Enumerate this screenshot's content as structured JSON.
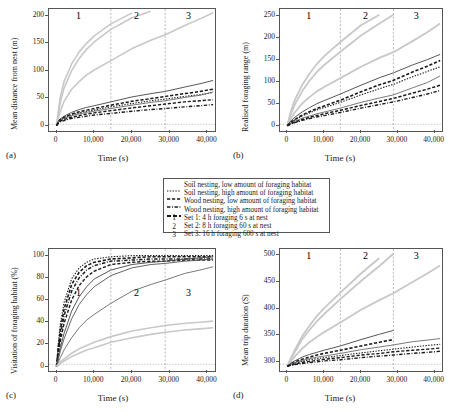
{
  "figure": {
    "xlabel": "Time (s)",
    "xticks": [
      "0",
      "10,000",
      "20,000",
      "30,000",
      "40,000"
    ],
    "xtick_values": [
      0,
      10000,
      20000,
      30000,
      40000
    ],
    "xlim": [
      -2000,
      42000
    ],
    "set_markers": [
      "1",
      "2",
      "3"
    ],
    "set_divider_x": [
      14400,
      28800
    ],
    "panel_tags": {
      "a": "(a)",
      "b": "(b)",
      "c": "(c)",
      "d": "(d)"
    }
  },
  "legend": {
    "series": [
      {
        "label": "Soil nesting, low amount of foraging habitat",
        "style": "fine-dotted",
        "color": "#1a1a1a"
      },
      {
        "label": "Soil nesting, high amount of foraging habitat",
        "style": "dashed",
        "color": "#1a1a1a"
      },
      {
        "label": "Wood nesting, low amount of foraging habitat",
        "style": "dash-dot",
        "color": "#1a1a1a"
      },
      {
        "label": "Wood nesting, high amount of foraging habitat",
        "style": "thick-dashed",
        "color": "#1a1a1a"
      }
    ],
    "sets": [
      {
        "key": "1",
        "label": "Set 1: 4 h foraging 6 s at nest"
      },
      {
        "key": "2",
        "label": "Set 2: 8 h foraging 60 s at nest"
      },
      {
        "key": "3",
        "label": "Set 3: 16 h foraging 600 s at nest"
      }
    ]
  },
  "chart_data": [
    {
      "panel": "a",
      "type": "line",
      "title": "",
      "xlabel": "Time (s)",
      "ylabel": "Mean distance from nest (m)",
      "xlim": [
        -2000,
        42000
      ],
      "ylim": [
        -10,
        212
      ],
      "yticks": [
        "0",
        "50",
        "100",
        "150",
        "200"
      ],
      "ytick_values": [
        0,
        50,
        100,
        150,
        200
      ],
      "grid": false,
      "legend_position": "external",
      "x": [
        0,
        500,
        1000,
        2000,
        4000,
        6000,
        8000,
        10000,
        14400,
        20000,
        25000,
        28800,
        34000,
        38000,
        41500
      ],
      "series": [
        {
          "name": "grey-steep-1",
          "color": "#c8c8c8",
          "width": 1.6,
          "style": "solid",
          "values": [
            0,
            28,
            52,
            80,
            112,
            134,
            150,
            163,
            185,
            205,
            null,
            null,
            null,
            null,
            null
          ]
        },
        {
          "name": "grey-steep-2",
          "color": "#c8c8c8",
          "width": 1.6,
          "style": "solid",
          "values": [
            0,
            22,
            42,
            68,
            100,
            122,
            139,
            152,
            175,
            196,
            208,
            null,
            null,
            null,
            null
          ]
        },
        {
          "name": "grey-mid",
          "color": "#c8c8c8",
          "width": 1.6,
          "style": "solid",
          "values": [
            0,
            14,
            26,
            44,
            66,
            80,
            92,
            101,
            118,
            140,
            155,
            165,
            182,
            194,
            205
          ]
        },
        {
          "name": "black-solid-high",
          "color": "#444444",
          "width": 0.9,
          "style": "solid",
          "values": [
            0,
            8,
            12,
            17,
            24,
            29,
            33,
            36,
            43,
            52,
            58,
            62,
            70,
            76,
            82
          ]
        },
        {
          "name": "black-dash-thick",
          "color": "#1a1a1a",
          "width": 1.5,
          "style": "dashed",
          "values": [
            0,
            7,
            11,
            15,
            21,
            25,
            28,
            31,
            37,
            44,
            49,
            53,
            58,
            62,
            66
          ]
        },
        {
          "name": "black-dot-fine",
          "color": "#1a1a1a",
          "width": 1.1,
          "style": "fine-dotted",
          "values": [
            0,
            6,
            10,
            14,
            19,
            23,
            26,
            28,
            34,
            40,
            45,
            48,
            53,
            56,
            60
          ]
        },
        {
          "name": "black-solid-low",
          "color": "#6a6a6a",
          "width": 0.9,
          "style": "solid",
          "values": [
            0,
            6,
            9,
            13,
            18,
            21,
            24,
            26,
            31,
            37,
            42,
            45,
            51,
            55,
            61
          ]
        },
        {
          "name": "black-dash-mid",
          "color": "#1a1a1a",
          "width": 1.4,
          "style": "dashed",
          "values": [
            0,
            5,
            8,
            11,
            15,
            18,
            21,
            23,
            27,
            32,
            36,
            39,
            43,
            45,
            47
          ]
        },
        {
          "name": "black-dashdot-low",
          "color": "#1a1a1a",
          "width": 1.4,
          "style": "dash-dot",
          "values": [
            0,
            4,
            7,
            9,
            13,
            15,
            17,
            19,
            22,
            26,
            29,
            31,
            34,
            36,
            38
          ]
        }
      ]
    },
    {
      "panel": "b",
      "type": "line",
      "title": "",
      "xlabel": "Time (s)",
      "ylabel": "Realised foraging range (m)",
      "xlim": [
        -2000,
        42000
      ],
      "ylim": [
        -12,
        265
      ],
      "yticks": [
        "0",
        "50",
        "100",
        "150",
        "200",
        "250"
      ],
      "ytick_values": [
        0,
        50,
        100,
        150,
        200,
        250
      ],
      "grid": false,
      "legend_position": "external",
      "x": [
        0,
        500,
        1000,
        2000,
        4000,
        6000,
        8000,
        10000,
        14400,
        20000,
        25000,
        28800,
        34000,
        38000,
        41500
      ],
      "series": [
        {
          "name": "grey-steep-1",
          "color": "#c8c8c8",
          "width": 1.8,
          "style": "solid",
          "values": [
            0,
            18,
            34,
            58,
            92,
            118,
            140,
            158,
            190,
            228,
            252,
            null,
            null,
            null,
            null
          ]
        },
        {
          "name": "grey-steep-2",
          "color": "#c8c8c8",
          "width": 1.8,
          "style": "solid",
          "values": [
            0,
            14,
            27,
            48,
            78,
            102,
            122,
            138,
            168,
            205,
            232,
            252,
            null,
            null,
            null
          ]
        },
        {
          "name": "grey-mid",
          "color": "#c8c8c8",
          "width": 1.8,
          "style": "solid",
          "values": [
            0,
            9,
            17,
            30,
            50,
            65,
            78,
            88,
            108,
            134,
            154,
            167,
            192,
            212,
            232
          ]
        },
        {
          "name": "black-solid-high",
          "color": "#444444",
          "width": 0.9,
          "style": "solid",
          "values": [
            0,
            6,
            11,
            19,
            31,
            41,
            50,
            57,
            72,
            92,
            109,
            120,
            138,
            150,
            162
          ]
        },
        {
          "name": "black-dash-thick",
          "color": "#1a1a1a",
          "width": 1.6,
          "style": "dashed",
          "values": [
            0,
            4,
            8,
            14,
            24,
            32,
            39,
            45,
            58,
            77,
            93,
            103,
            122,
            135,
            148
          ]
        },
        {
          "name": "black-dot-fine",
          "color": "#1a1a1a",
          "width": 1.1,
          "style": "fine-dotted",
          "values": [
            0,
            4,
            7,
            13,
            22,
            29,
            36,
            41,
            53,
            70,
            84,
            94,
            111,
            123,
            134
          ]
        },
        {
          "name": "black-solid-low",
          "color": "#6a6a6a",
          "width": 0.9,
          "style": "solid",
          "values": [
            0,
            3,
            6,
            10,
            17,
            22,
            27,
            31,
            40,
            53,
            63,
            70,
            86,
            98,
            113
          ]
        },
        {
          "name": "black-dash-mid",
          "color": "#1a1a1a",
          "width": 1.5,
          "style": "dashed",
          "values": [
            0,
            2,
            5,
            8,
            14,
            19,
            23,
            27,
            35,
            46,
            55,
            62,
            74,
            83,
            92
          ]
        },
        {
          "name": "black-dashdot-low",
          "color": "#1a1a1a",
          "width": 1.4,
          "style": "dash-dot",
          "values": [
            0,
            2,
            4,
            7,
            12,
            16,
            20,
            23,
            30,
            40,
            48,
            54,
            64,
            72,
            80
          ]
        }
      ]
    },
    {
      "panel": "c",
      "type": "line",
      "title": "",
      "xlabel": "Time (s)",
      "ylabel": "Visitation of foraging habitat (%)",
      "xlim": [
        -2000,
        42000
      ],
      "ylim": [
        -4,
        106
      ],
      "yticks": [
        "0",
        "20",
        "40",
        "60",
        "80",
        "100"
      ],
      "ytick_values": [
        0,
        20,
        40,
        60,
        80,
        100
      ],
      "grid": false,
      "legend_position": "external",
      "x": [
        0,
        500,
        1000,
        2000,
        4000,
        6000,
        8000,
        10000,
        14400,
        20000,
        25000,
        28800,
        34000,
        38000,
        41500
      ],
      "series": [
        {
          "name": "black-dot-fastest",
          "color": "#1a1a1a",
          "width": 1.1,
          "style": "fine-dotted",
          "values": [
            0,
            22,
            38,
            58,
            79,
            89,
            94,
            97,
            99,
            100,
            100,
            100,
            100,
            100,
            100
          ]
        },
        {
          "name": "black-dash-fast",
          "color": "#1a1a1a",
          "width": 1.6,
          "style": "dashed",
          "values": [
            0,
            18,
            33,
            52,
            74,
            85,
            91,
            94,
            97,
            98,
            99,
            99,
            99,
            99,
            99
          ]
        },
        {
          "name": "black-dashdot-fast",
          "color": "#1a1a1a",
          "width": 1.5,
          "style": "dash-dot",
          "values": [
            0,
            15,
            28,
            46,
            68,
            80,
            87,
            91,
            95,
            96,
            97,
            97,
            97,
            97,
            97
          ]
        },
        {
          "name": "black-dash-mid",
          "color": "#1a1a1a",
          "width": 1.4,
          "style": "dashed",
          "values": [
            0,
            12,
            23,
            39,
            60,
            73,
            81,
            86,
            92,
            94,
            95,
            95,
            96,
            96,
            96
          ]
        },
        {
          "name": "black-solid-high",
          "color": "#444444",
          "width": 0.9,
          "style": "solid",
          "values": [
            0,
            9,
            17,
            30,
            50,
            63,
            72,
            79,
            87,
            92,
            94,
            95,
            97,
            98,
            99
          ]
        },
        {
          "name": "black-solid-mid",
          "color": "#555555",
          "width": 0.9,
          "style": "solid",
          "values": [
            0,
            7,
            14,
            25,
            43,
            56,
            65,
            72,
            82,
            89,
            92,
            93,
            95,
            96,
            97
          ]
        },
        {
          "name": "black-solid-low",
          "color": "#6a6a6a",
          "width": 0.9,
          "style": "solid",
          "values": [
            0,
            4,
            8,
            15,
            26,
            35,
            42,
            47,
            57,
            68,
            74,
            78,
            84,
            87,
            90
          ]
        },
        {
          "name": "grey-upper",
          "color": "#c8c8c8",
          "width": 1.6,
          "style": "solid",
          "values": [
            0,
            2,
            4,
            7,
            12,
            16,
            19,
            22,
            27,
            32,
            35,
            37,
            39,
            40,
            41
          ]
        },
        {
          "name": "grey-lower",
          "color": "#c8c8c8",
          "width": 1.6,
          "style": "solid",
          "values": [
            0,
            1,
            3,
            5,
            9,
            12,
            15,
            17,
            22,
            26,
            29,
            31,
            33,
            34,
            35
          ]
        }
      ]
    },
    {
      "panel": "d",
      "type": "line",
      "title": "",
      "xlabel": "Time (s)",
      "ylabel": "Mean trip duration (S)",
      "xlim": [
        -2000,
        42000
      ],
      "ylim": [
        283,
        512
      ],
      "yticks": [
        "300",
        "350",
        "400",
        "450",
        "500"
      ],
      "ytick_values": [
        300,
        350,
        400,
        450,
        500
      ],
      "grid": false,
      "legend_position": "external",
      "x": [
        0,
        500,
        1000,
        2000,
        4000,
        6000,
        8000,
        10000,
        14400,
        20000,
        25000,
        28800,
        34000,
        38000,
        41500
      ],
      "series": [
        {
          "name": "grey-steep-1",
          "color": "#c8c8c8",
          "width": 1.8,
          "style": "solid",
          "values": [
            292,
            300,
            308,
            322,
            348,
            368,
            386,
            401,
            430,
            466,
            495,
            null,
            null,
            null,
            null
          ]
        },
        {
          "name": "grey-steep-2",
          "color": "#c8c8c8",
          "width": 1.8,
          "style": "solid",
          "values": [
            292,
            299,
            306,
            318,
            342,
            360,
            376,
            390,
            418,
            452,
            480,
            503,
            null,
            null,
            null
          ]
        },
        {
          "name": "grey-mid",
          "color": "#c8c8c8",
          "width": 1.8,
          "style": "solid",
          "values": [
            292,
            297,
            302,
            310,
            325,
            337,
            347,
            356,
            374,
            398,
            416,
            429,
            450,
            466,
            481
          ]
        },
        {
          "name": "black-solid-high",
          "color": "#444444",
          "width": 0.9,
          "style": "solid",
          "values": [
            292,
            295,
            298,
            302,
            309,
            314,
            318,
            322,
            330,
            342,
            352,
            359,
            null,
            null,
            null
          ]
        },
        {
          "name": "black-dash-thick",
          "color": "#1a1a1a",
          "width": 1.6,
          "style": "dashed",
          "values": [
            292,
            294,
            296,
            300,
            305,
            309,
            313,
            316,
            322,
            330,
            337,
            342,
            null,
            null,
            null
          ]
        },
        {
          "name": "black-solid-low",
          "color": "#6a6a6a",
          "width": 0.9,
          "style": "solid",
          "values": [
            292,
            294,
            296,
            299,
            303,
            306,
            309,
            311,
            316,
            323,
            328,
            332,
            338,
            341,
            344
          ]
        },
        {
          "name": "black-dot-fine",
          "color": "#1a1a1a",
          "width": 1.1,
          "style": "fine-dotted",
          "values": [
            292,
            293,
            295,
            297,
            301,
            304,
            306,
            308,
            312,
            317,
            321,
            324,
            328,
            331,
            333
          ]
        },
        {
          "name": "black-dash-mid",
          "color": "#1a1a1a",
          "width": 1.4,
          "style": "dashed",
          "values": [
            292,
            293,
            294,
            296,
            299,
            301,
            303,
            305,
            308,
            313,
            316,
            319,
            322,
            324,
            326
          ]
        },
        {
          "name": "black-dashdot-low",
          "color": "#1a1a1a",
          "width": 1.4,
          "style": "dash-dot",
          "values": [
            292,
            293,
            294,
            295,
            297,
            299,
            300,
            302,
            304,
            308,
            311,
            313,
            316,
            318,
            320
          ]
        }
      ]
    }
  ]
}
